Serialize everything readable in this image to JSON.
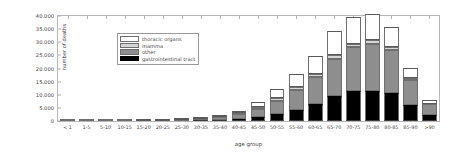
{
  "chart_data": {
    "type": "bar",
    "stacked": true,
    "title": "",
    "xlabel": "age group",
    "ylabel": "number of deaths",
    "ylim": [
      0,
      40000
    ],
    "grid": false,
    "legend_position": "upper left",
    "ytick_labels": [
      "0",
      "5.000",
      "10.000",
      "15.000",
      "20.000",
      "25.000",
      "30.000",
      "35.000",
      "40.000"
    ],
    "ytick_values": [
      0,
      5000,
      10000,
      15000,
      20000,
      25000,
      30000,
      35000,
      40000
    ],
    "categories": [
      "< 1",
      "1-5",
      "5-10",
      "10-15",
      "15-20",
      "20-25",
      "25-30",
      "30-35",
      "35-40",
      "40-45",
      "45-50",
      "50-55",
      "55-60",
      "60-65",
      "65-70",
      "70-75",
      "75-80",
      "80-85",
      "85-90",
      ">90"
    ],
    "series": [
      {
        "name": "gastrointestinal tract",
        "color": "#000000",
        "values": [
          0,
          0,
          0,
          0,
          0,
          40,
          90,
          200,
          400,
          700,
          1400,
          2600,
          4300,
          6500,
          9700,
          11300,
          11600,
          10700,
          6100,
          2400
        ]
      },
      {
        "name": "other",
        "color": "#8e8e8e",
        "values": [
          20,
          30,
          30,
          30,
          60,
          130,
          260,
          500,
          1000,
          1800,
          3200,
          5200,
          7600,
          10200,
          14100,
          16800,
          17900,
          16400,
          9700,
          4000
        ]
      },
      {
        "name": "mamma",
        "color": "#d6d6d6",
        "values": [
          0,
          0,
          0,
          0,
          0,
          10,
          40,
          120,
          280,
          500,
          800,
          1000,
          1100,
          1200,
          1300,
          1300,
          1200,
          1000,
          600,
          250
        ]
      },
      {
        "name": "thoracic organs",
        "color": "#ffffff",
        "values": [
          0,
          0,
          0,
          0,
          10,
          30,
          80,
          200,
          450,
          900,
          1900,
          3300,
          5100,
          6900,
          9300,
          10300,
          9900,
          7800,
          3800,
          1250
        ]
      }
    ]
  },
  "legend": {
    "entries": [
      {
        "label": "thoracic organs"
      },
      {
        "label": "mamma"
      },
      {
        "label": "other"
      },
      {
        "label": "gastrointestinal tract"
      }
    ]
  }
}
